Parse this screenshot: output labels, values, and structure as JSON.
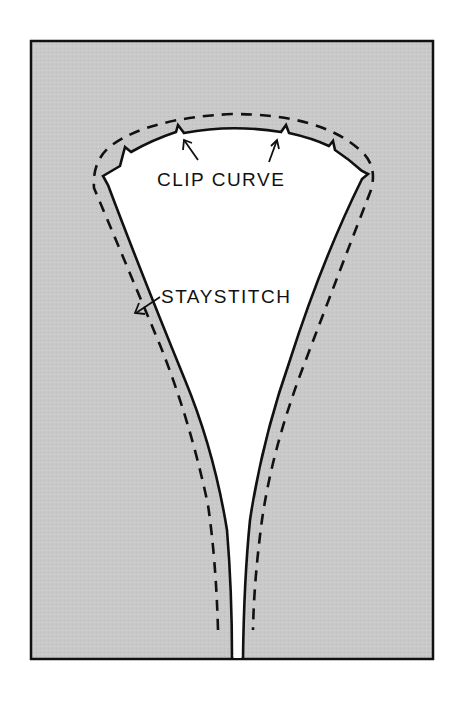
{
  "diagram": {
    "type": "sewing-instruction-illustration",
    "colors": {
      "background": "#ffffff",
      "fabric": "#c9c9c9",
      "opening": "#ffffff",
      "ink": "#111111"
    },
    "labels": {
      "clip_curve": "CLIP CURVE",
      "staystitch": "STAYSTITCH"
    },
    "elements": [
      {
        "id": "fabric-panel",
        "description": "Gray rectangular fabric piece with black border"
      },
      {
        "id": "neck-opening",
        "description": "White keyhole/V-shaped opening with curved top narrowing to a slit at bottom"
      },
      {
        "id": "clip-notches",
        "count": 6,
        "description": "Small V-shaped clips cut into the curved seam allowance"
      },
      {
        "id": "staystitch-line",
        "description": "Dashed stitching line following outside of opening"
      },
      {
        "id": "clip-arrows",
        "count": 2,
        "points_to": "clip-notches"
      },
      {
        "id": "staystitch-arrow",
        "count": 1,
        "points_to": "staystitch-line"
      }
    ]
  }
}
